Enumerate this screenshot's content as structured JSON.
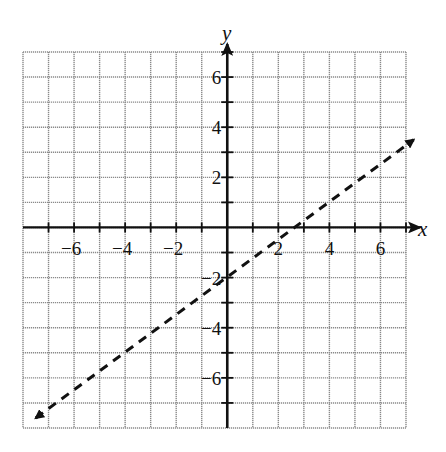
{
  "chart_data": {
    "type": "line",
    "title": "",
    "xlabel": "x",
    "ylabel": "y",
    "xlim": [
      -8,
      7
    ],
    "ylim": [
      -8,
      7
    ],
    "grid": true,
    "x_tick_labels": [
      "-6",
      "-4",
      "-2",
      "2",
      "4",
      "6"
    ],
    "y_tick_labels": [
      "6",
      "4",
      "2",
      "-2",
      "-4",
      "-6"
    ],
    "series": [
      {
        "name": "line",
        "style": "dashed",
        "arrows": "both",
        "equation": "y = 3/4 x - 2",
        "slope": 0.75,
        "intercept": -2,
        "x": [
          -7.5,
          0,
          2.67,
          4,
          7.3
        ],
        "y": [
          -7.6,
          -2,
          0,
          1,
          3.5
        ]
      }
    ]
  },
  "labels": {
    "x_axis": "x",
    "y_axis": "y",
    "xticks": [
      {
        "v": -6,
        "t": "−6"
      },
      {
        "v": -4,
        "t": "−4"
      },
      {
        "v": -2,
        "t": "−2"
      },
      {
        "v": 2,
        "t": "2"
      },
      {
        "v": 4,
        "t": "4"
      },
      {
        "v": 6,
        "t": "6"
      }
    ],
    "yticks": [
      {
        "v": 6,
        "t": "6"
      },
      {
        "v": 4,
        "t": "4"
      },
      {
        "v": 2,
        "t": "2"
      },
      {
        "v": -2,
        "t": "−2"
      },
      {
        "v": -4,
        "t": "−4"
      },
      {
        "v": -6,
        "t": "−6"
      }
    ]
  }
}
